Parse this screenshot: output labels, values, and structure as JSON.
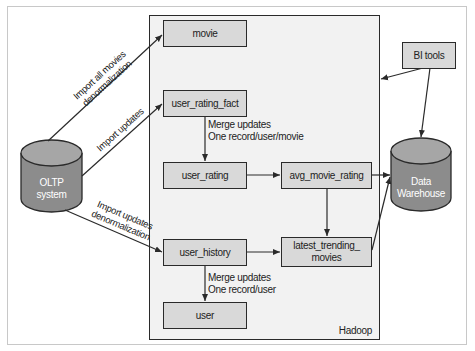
{
  "diagram": {
    "container": {
      "label": "Hadoop"
    },
    "sources": {
      "oltp": {
        "label_line1": "OLTP",
        "label_line2": "system"
      }
    },
    "sinks": {
      "warehouse": {
        "label_line1": "Data",
        "label_line2": "Warehouse"
      }
    },
    "tools": {
      "bi": "BI tools"
    },
    "nodes": {
      "movie": "movie",
      "user_rating_fact": "user_rating_fact",
      "user_rating": "user_rating",
      "avg_movie_rating": "avg_movie_rating",
      "user_history": "user_history",
      "latest_trending_line1": "latest_trending_",
      "latest_trending_line2": "movies",
      "user": "user"
    },
    "edge_labels": {
      "import_all_line1": "Import all movies",
      "import_all_line2": "denormalization",
      "import_updates": "Import updates",
      "import_updates_denorm_line1": "Import updates",
      "import_updates_denorm_line2": "denormalization",
      "merge_movie_line1": "Merge updates",
      "merge_movie_line2": "One record/user/movie",
      "merge_user_line1": "Merge updates",
      "merge_user_line2": "One record/user"
    },
    "colors": {
      "node_fill": "#d9d9d9",
      "container_fill": "#f2f2f2",
      "cylinder_fill": "#8c8c8c",
      "cylinder_top": "#a6a6a6",
      "stroke": "#2a2a2a"
    }
  }
}
